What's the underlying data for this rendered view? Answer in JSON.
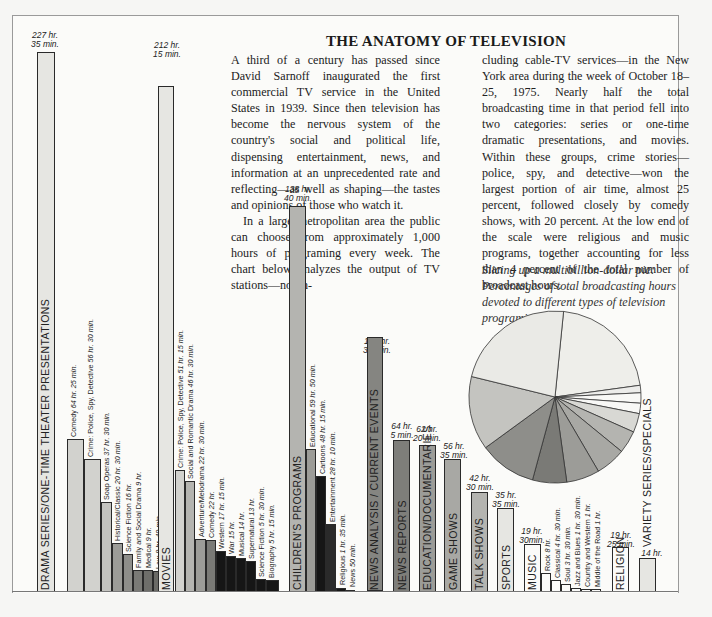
{
  "article": {
    "title": "THE ANATOMY OF TELEVISION",
    "col1_p1": "A third of a century has passed since David Sarnoff inaugurated the first commercial TV service in the United States in 1939. Since then television has become the nervous system of the country's social and political life, dispensing entertainment, news, and information at an unprecedented rate and reflecting—as well as shaping—the tastes and opinions of those who watch it.",
    "col1_p2": "In a large metropolitan area the public can choose from approximately 1,000 hours of programing every week. The chart below analyzes the output of TV stations—not in-",
    "col2_p1": "cluding cable-TV services—in the New York area during the week of October 18–25, 1975. Nearly half the total broadcasting time in that period fell into two categories: series or one-time dramatic presentations, and movies. Within these groups, crime stories—police, spy, and detective—won the largest portion of air time, almost 25 percent, followed closely by comedy shows, with 20 percent. At the low end of the scale were religious and music programs, together accounting for less than 4 percent of the total number of broadcast hours.",
    "caption": "Slicing up a multibillion-dollar pie: Percentages of total broadcasting hours devoted to different types of television programing."
  },
  "chart_data": [
    {
      "type": "bar",
      "title": "THE ANATOMY OF TELEVISION",
      "xlabel": "",
      "ylabel": "Broadcast hours per week",
      "units": "hours",
      "grid": false,
      "categories": [
        "DRAMA SERIES/ONE-TIME THEATER PRESENTATIONS",
        "MOVIES",
        "CHILDREN'S PROGRAMS",
        "NEWS ANALYSIS / CURRENT EVENTS",
        "NEWS REPORTS",
        "EDUCATION/DOCUMENTARIES",
        "GAME SHOWS",
        "TALK SHOWS",
        "SPORTS",
        "MUSIC",
        "RELIGION",
        "VARIETY SERIES/SPECIALS"
      ],
      "value_labels": [
        "227 hr. 35 min.",
        "212 hr. 15 min.",
        "138 hr. 40 min.",
        "107 hr. 30 min.",
        "64 hr. 5 min.",
        "62 hr. 20 min.",
        "56 hr. 35 min.",
        "42 hr. 30 min.",
        "35 hr. 35 min.",
        "19 hr. 30min.",
        "19 hr. 25 min.",
        "14 hr."
      ],
      "values": [
        227.58,
        212.25,
        138.67,
        107.5,
        64.08,
        62.33,
        56.58,
        42.5,
        35.58,
        19.5,
        19.42,
        14.0
      ],
      "subcategories": {
        "DRAMA SERIES/ONE-TIME THEATER PRESENTATIONS": [
          {
            "label": "Comedy",
            "value_label": "64 hr. 25 min.",
            "value": 64.42
          },
          {
            "label": "Crime: Police, Spy, Detective",
            "value_label": "56 hr. 30 min.",
            "value": 56.5
          },
          {
            "label": "Soap Operas",
            "value_label": "37 hr. 30 min.",
            "value": 37.5
          },
          {
            "label": "Historical/Classic",
            "value_label": "20 hr. 30 min.",
            "value": 20.5
          },
          {
            "label": "Science Fiction",
            "value_label": "16 hr.",
            "value": 16
          },
          {
            "label": "Family and Social Drama",
            "value_label": "9 hr.",
            "value": 9
          },
          {
            "label": "Medical",
            "value_label": "9 hr.",
            "value": 9
          },
          {
            "label": "Law",
            "value_label": "8 hr. 40 min.",
            "value": 8.67
          },
          {
            "label": "Westerns",
            "value_label": "6 hr.",
            "value": 6
          }
        ],
        "MOVIES": [
          {
            "label": "Crime: Police, Spy, Detective",
            "value_label": "51 hr. 15 min.",
            "value": 51.25
          },
          {
            "label": "Social and Romantic Drama",
            "value_label": "46 hr. 30 min.",
            "value": 46.5
          },
          {
            "label": "Adventure/Melodrama",
            "value_label": "22 hr. 30 min.",
            "value": 22.5
          },
          {
            "label": "Comedy",
            "value_label": "22 hr.",
            "value": 22
          },
          {
            "label": "Western",
            "value_label": "17 hr. 15 min.",
            "value": 17.25
          },
          {
            "label": "War",
            "value_label": "15 hr.",
            "value": 15
          },
          {
            "label": "Musical",
            "value_label": "14 hr.",
            "value": 14
          },
          {
            "label": "Supernatural",
            "value_label": "13 hr.",
            "value": 13
          },
          {
            "label": "Science Fiction",
            "value_label": "5 hr. 30 min.",
            "value": 5.5
          },
          {
            "label": "Biography",
            "value_label": "5 hr. 15 min.",
            "value": 5.25
          }
        ],
        "CHILDREN'S PROGRAMS": [
          {
            "label": "Educational",
            "value_label": "59 hr. 50 min.",
            "value": 59.83
          },
          {
            "label": "Cartoons",
            "value_label": "48 hr. 15 min.",
            "value": 48.25
          },
          {
            "label": "Entertainment",
            "value_label": "28 hr. 10 min.",
            "value": 28.17
          },
          {
            "label": "Religious",
            "value_label": "1 hr. 35 min.",
            "value": 1.58
          },
          {
            "label": "News",
            "value_label": "50 min.",
            "value": 0.83
          }
        ],
        "MUSIC": [
          {
            "label": "Rock",
            "value_label": "8 hr.",
            "value": 8
          },
          {
            "label": "Classical",
            "value_label": "4 hr. 30 min.",
            "value": 4.5
          },
          {
            "label": "Soul",
            "value_label": "3 hr. 30 min.",
            "value": 3.5
          },
          {
            "label": "Jazz and Blues",
            "value_label": "1 hr. 30 min.",
            "value": 1.5
          },
          {
            "label": "Country and Western",
            "value_label": "1 hr.",
            "value": 1
          },
          {
            "label": "Middle of the Road",
            "value_label": "1 hr.",
            "value": 1
          }
        ]
      },
      "legend": "none"
    },
    {
      "type": "pie",
      "title": "Slicing up a multibillion-dollar pie",
      "categories": [
        "Drama series/one-time theater presentations",
        "Movies",
        "Children's programs",
        "News analysis / current events",
        "News reports",
        "Education/documentaries",
        "Game shows",
        "Talk shows",
        "Sports",
        "Music",
        "Religion",
        "Variety series/specials"
      ],
      "values": [
        227.58,
        212.25,
        138.67,
        107.5,
        64.08,
        62.33,
        56.58,
        42.5,
        35.58,
        19.5,
        19.42,
        14.0
      ],
      "note": "Slice sizes proportional to total broadcasting hours; percentages not labeled"
    }
  ],
  "labels": {
    "drama": "DRAMA SERIES/ONE-TIME THEATER PRESENTATIONS",
    "movies": "MOVIES",
    "children": "CHILDREN'S PROGRAMS",
    "newsanalysis": "NEWS ANALYSIS / CURRENT EVENTS",
    "newsreports": "NEWS REPORTS",
    "education": "EDUCATION/DOCUMENTARIES",
    "game": "GAME SHOWS",
    "talk": "TALK SHOWS",
    "sports": "SPORTS",
    "music": "MUSIC",
    "religion": "RELIGION",
    "variety": "VARIETY SERIES/SPECIALS"
  },
  "values": {
    "drama_a": "227 hr.",
    "drama_b": "35 min.",
    "movies_a": "212 hr.",
    "movies_b": "15 min.",
    "children_a": "138 hr.",
    "children_b": "40 min.",
    "newsanalysis_a": "107 hr.",
    "newsanalysis_b": "30 min.",
    "newsreports_a": "64 hr.",
    "newsreports_b": "5 min.",
    "education_a": "62 hr.",
    "education_b": "20 min.",
    "game_a": "56 hr.",
    "game_b": "35 min.",
    "talk_a": "42 hr.",
    "talk_b": "30 min.",
    "sports_a": "35 hr.",
    "sports_b": "35 min.",
    "music_a": "19 hr.",
    "music_b": "30min.",
    "religion_a": "19 hr.",
    "religion_b": "25 min.",
    "variety_a": "14 hr."
  },
  "sub": {
    "d1": "Comedy",
    "d1v": "64 hr. 25 min.",
    "d2": "Crime: Police, Spy, Detective",
    "d2v": "56 hr. 30 min.",
    "d3": "Soap Operas",
    "d3v": "37 hr. 30 min.",
    "d4": "Historical/Classic",
    "d4v": "20 hr. 30 min.",
    "d5": "Science Fiction",
    "d5v": "16 hr.",
    "d6": "Family and Social Drama",
    "d6v": "9 hr.",
    "d7": "Medical",
    "d7v": "9 hr.",
    "d8": "Law",
    "d8v": "8 hr. 40 min.",
    "d9": "Westerns",
    "d9v": "6 hr.",
    "m1": "Crime: Police, Spy, Detective",
    "m1v": "51 hr. 15 min.",
    "m2": "Social and Romantic Drama",
    "m2v": "46 hr. 30 min.",
    "m3": "Adventure/Melodrama",
    "m3v": "22 hr. 30 min.",
    "m4": "Comedy",
    "m4v": "22 hr.",
    "m5": "Western",
    "m5v": "17 hr. 15 min.",
    "m6": "War",
    "m6v": "15 hr.",
    "m7": "Musical",
    "m7v": "14 hr.",
    "m8": "Supernatural",
    "m8v": "13 hr.",
    "m9": "Science Fiction",
    "m9v": "5 hr. 30 min.",
    "m10": "Biography",
    "m10v": "5 hr. 15 min.",
    "c1": "Educational",
    "c1v": "59 hr. 50 min.",
    "c2": "Cartoons",
    "c2v": "48 hr. 15 min.",
    "c3": "Entertainment",
    "c3v": "28 hr. 10 min.",
    "c4": "Religious",
    "c4v": "1 hr. 35 min.",
    "c5": "News",
    "c5v": "50 min.",
    "u1": "Rock",
    "u1v": "8 hr.",
    "u2": "Classical",
    "u2v": "4 hr. 30 min.",
    "u3": "Soul",
    "u3v": "3 hr. 30 min.",
    "u4": "Jazz and Blues",
    "u4v": "1 hr. 30 min.",
    "u5": "Country and Western",
    "u5v": "1 hr.",
    "u6": "Middle of the Road",
    "u6v": "1 hr."
  },
  "colors": {
    "light": "#e6e6e2",
    "light2": "#d2d2ce",
    "mid": "#b4b4b0",
    "mid2": "#9c9c98",
    "dark": "#858581",
    "darker": "#6e6e6a",
    "black": "#161616",
    "white": "#fbfbf9"
  }
}
